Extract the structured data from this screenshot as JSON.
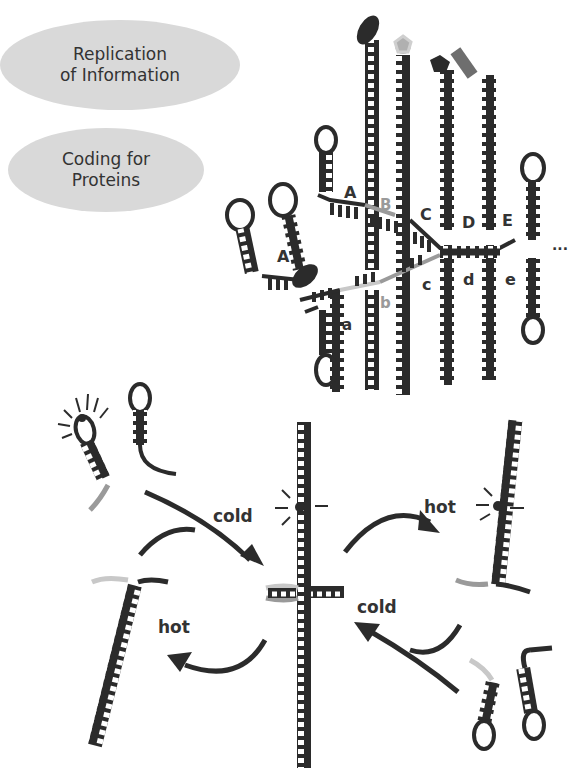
{
  "legend": {
    "replication": {
      "line1": "Replication",
      "line2": "of Information"
    },
    "coding": {
      "line1": "Coding for",
      "line2": "Proteins"
    }
  },
  "upper_labels": {
    "top_strand": [
      "A",
      "A",
      "B",
      "C",
      "D",
      "E"
    ],
    "bottom_strand": [
      "a",
      "b",
      "c",
      "d",
      "e"
    ],
    "ellipsis": "..."
  },
  "cycle_labels": {
    "cold_1": "cold",
    "hot_1": "hot",
    "cold_2": "cold",
    "hot_2": "hot"
  },
  "colors": {
    "strand": "#2b2b2b",
    "highlight_gray": "#9a9a9a",
    "light_gray": "#c8c8c8",
    "bubble_fill": "#d9d9d9",
    "label_text": "#333333"
  }
}
